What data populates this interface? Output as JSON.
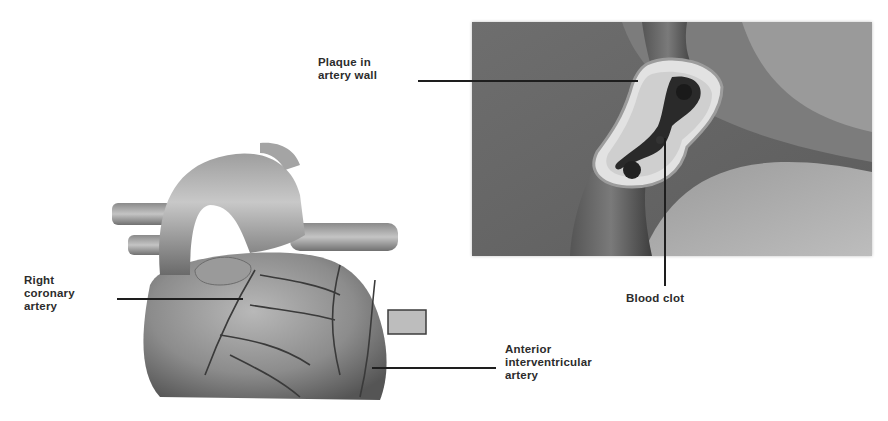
{
  "diagram": {
    "labels": {
      "plaque": "Plaque in\nartery wall",
      "blood_clot": "Blood clot",
      "right_coronary": "Right\ncoronary\nartery",
      "anterior_interventricular": "Anterior\ninterventricular\nartery"
    },
    "colors": {
      "background": "#ffffff",
      "label_text": "#2c2c2c",
      "leader_line": "#1e1e1e",
      "inset_background": "#6a6a6a",
      "heart_tissue": "#8a8a8a",
      "vessel": "#9a9a9a"
    }
  }
}
